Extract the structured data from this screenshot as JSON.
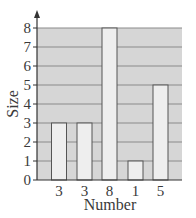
{
  "chart_data": {
    "type": "bar",
    "title": "",
    "xlabel": "Number",
    "ylabel": "Size",
    "categories": [
      "3",
      "3",
      "8",
      "1",
      "5"
    ],
    "values": [
      3,
      3,
      8,
      1,
      5
    ],
    "ylim": [
      0,
      8
    ],
    "yticks": [
      0,
      1,
      2,
      3,
      4,
      5,
      6,
      7,
      8
    ],
    "grid": true,
    "legend": null
  },
  "colors": {
    "plot_background": "#d6d6d6",
    "gridline": "#8a8a8a",
    "bar_fill": "#eeeeee",
    "bar_stroke": "#555555",
    "axis": "#333333"
  }
}
